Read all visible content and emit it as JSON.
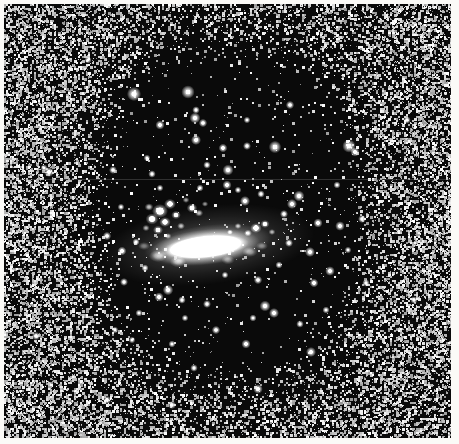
{
  "figure": {
    "kind": "astronomical-plate-photograph",
    "rendering": "halftone / dithered monochrome print",
    "width": 459,
    "height": 444,
    "caption": ""
  },
  "palette": {
    "paper": "#fbfaf7",
    "backdrop": "#f2f1ee",
    "sky_dark": "#0a0a0a",
    "ink_black": "#000000",
    "star_white": "#ffffff",
    "halo_gray": "#b4b4b4",
    "seam_gray": "#8c8c8c"
  },
  "margins": {
    "left": 4,
    "top": 4,
    "right": 8,
    "bottom": 6
  },
  "sky_field": {
    "x": 4,
    "y": 4,
    "width": 447,
    "height": 434
  },
  "scan_seam": {
    "y": 179,
    "opacity": 0.3
  },
  "noise_halo": {
    "description": "salt-and-pepper dithered grain forming a bright halo around a dark rounded-rectangular sky region",
    "center_x": 231,
    "center_y": 212,
    "inner_radius_x": 132,
    "inner_radius_y": 172,
    "outer_radius_x": 232,
    "outer_radius_y": 262,
    "superellipse_exponent": 2.7,
    "max_coverage": 0.52,
    "grain_cell": 2,
    "seed": 20250411
  },
  "dark_region": {
    "x_min": 86,
    "x_max": 382,
    "y_min": 22,
    "y_max": 402
  },
  "galaxy": {
    "core": {
      "center_x": 205,
      "center_y": 247,
      "radius_x": 44,
      "radius_y": 11,
      "rotation_deg": -6,
      "peak_brightness": 1.0,
      "label": "bright elongated nucleus"
    },
    "inner_disk": {
      "center_x": 208,
      "center_y": 245,
      "radius_x": 64,
      "radius_y": 20,
      "rotation_deg": -7,
      "peak_brightness": 0.55
    },
    "knot_complex": {
      "label": "clumpy star-forming knots, north-east of nucleus",
      "clumps": [
        {
          "x": 160,
          "y": 211,
          "r": 7.0,
          "b": 1.0
        },
        {
          "x": 170,
          "y": 204,
          "r": 5.2,
          "b": 0.95
        },
        {
          "x": 152,
          "y": 219,
          "r": 5.6,
          "b": 0.92
        },
        {
          "x": 165,
          "y": 222,
          "r": 5.0,
          "b": 0.9
        },
        {
          "x": 176,
          "y": 215,
          "r": 4.2,
          "b": 0.85
        },
        {
          "x": 158,
          "y": 230,
          "r": 4.4,
          "b": 0.82
        },
        {
          "x": 149,
          "y": 207,
          "r": 3.8,
          "b": 0.8
        },
        {
          "x": 181,
          "y": 226,
          "r": 3.4,
          "b": 0.72
        },
        {
          "x": 146,
          "y": 228,
          "r": 3.2,
          "b": 0.7
        },
        {
          "x": 192,
          "y": 208,
          "r": 4.6,
          "b": 0.88
        },
        {
          "x": 199,
          "y": 213,
          "r": 3.6,
          "b": 0.76
        },
        {
          "x": 186,
          "y": 200,
          "r": 3.0,
          "b": 0.66
        },
        {
          "x": 205,
          "y": 204,
          "r": 2.8,
          "b": 0.62
        },
        {
          "x": 168,
          "y": 236,
          "r": 3.0,
          "b": 0.64
        },
        {
          "x": 256,
          "y": 228,
          "r": 5.0,
          "b": 0.9
        },
        {
          "x": 265,
          "y": 224,
          "r": 4.0,
          "b": 0.82
        },
        {
          "x": 248,
          "y": 233,
          "r": 3.4,
          "b": 0.74
        },
        {
          "x": 238,
          "y": 226,
          "r": 3.0,
          "b": 0.68
        },
        {
          "x": 272,
          "y": 232,
          "r": 3.0,
          "b": 0.66
        },
        {
          "x": 230,
          "y": 232,
          "r": 2.6,
          "b": 0.6
        }
      ]
    },
    "outer_wisps": [
      {
        "x": 158,
        "y": 256,
        "r": 6.0,
        "b": 0.5
      },
      {
        "x": 250,
        "y": 252,
        "r": 5.0,
        "b": 0.46
      },
      {
        "x": 178,
        "y": 262,
        "r": 5.4,
        "b": 0.48
      },
      {
        "x": 228,
        "y": 260,
        "r": 4.4,
        "b": 0.42
      },
      {
        "x": 144,
        "y": 246,
        "r": 4.0,
        "b": 0.4
      },
      {
        "x": 262,
        "y": 246,
        "r": 4.0,
        "b": 0.38
      }
    ]
  },
  "stars": [
    {
      "x": 134,
      "y": 94,
      "r": 3.4
    },
    {
      "x": 188,
      "y": 92,
      "r": 3.2
    },
    {
      "x": 275,
      "y": 147,
      "r": 3.0
    },
    {
      "x": 349,
      "y": 146,
      "r": 3.2
    },
    {
      "x": 355,
      "y": 152,
      "r": 2.2
    },
    {
      "x": 160,
      "y": 125,
      "r": 2.2
    },
    {
      "x": 196,
      "y": 110,
      "r": 1.8
    },
    {
      "x": 228,
      "y": 170,
      "r": 2.6
    },
    {
      "x": 196,
      "y": 140,
      "r": 2.4
    },
    {
      "x": 207,
      "y": 165,
      "r": 1.8
    },
    {
      "x": 247,
      "y": 120,
      "r": 1.6
    },
    {
      "x": 195,
      "y": 118,
      "r": 2.6
    },
    {
      "x": 203,
      "y": 123,
      "r": 2.0
    },
    {
      "x": 247,
      "y": 146,
      "r": 1.9
    },
    {
      "x": 223,
      "y": 148,
      "r": 2.1
    },
    {
      "x": 113,
      "y": 170,
      "r": 1.9
    },
    {
      "x": 152,
      "y": 174,
      "r": 1.8
    },
    {
      "x": 299,
      "y": 196,
      "r": 2.6
    },
    {
      "x": 292,
      "y": 204,
      "r": 2.4
    },
    {
      "x": 245,
      "y": 201,
      "r": 2.4
    },
    {
      "x": 261,
      "y": 194,
      "r": 1.8
    },
    {
      "x": 318,
      "y": 223,
      "r": 2.2
    },
    {
      "x": 284,
      "y": 214,
      "r": 1.9
    },
    {
      "x": 340,
      "y": 226,
      "r": 2.3
    },
    {
      "x": 107,
      "y": 236,
      "r": 2.0
    },
    {
      "x": 122,
      "y": 251,
      "r": 2.1
    },
    {
      "x": 136,
      "y": 242,
      "r": 1.7
    },
    {
      "x": 310,
      "y": 252,
      "r": 2.4
    },
    {
      "x": 289,
      "y": 243,
      "r": 1.9
    },
    {
      "x": 330,
      "y": 271,
      "r": 2.3
    },
    {
      "x": 314,
      "y": 283,
      "r": 2.1
    },
    {
      "x": 258,
      "y": 280,
      "r": 2.0
    },
    {
      "x": 168,
      "y": 290,
      "r": 2.5
    },
    {
      "x": 159,
      "y": 297,
      "r": 2.2
    },
    {
      "x": 182,
      "y": 300,
      "r": 1.8
    },
    {
      "x": 207,
      "y": 304,
      "r": 1.9
    },
    {
      "x": 124,
      "y": 282,
      "r": 1.9
    },
    {
      "x": 265,
      "y": 306,
      "r": 2.6
    },
    {
      "x": 274,
      "y": 313,
      "r": 2.4
    },
    {
      "x": 253,
      "y": 318,
      "r": 1.7
    },
    {
      "x": 185,
      "y": 318,
      "r": 1.6
    },
    {
      "x": 139,
      "y": 313,
      "r": 1.7
    },
    {
      "x": 300,
      "y": 324,
      "r": 1.8
    },
    {
      "x": 216,
      "y": 330,
      "r": 2.0
    },
    {
      "x": 246,
      "y": 344,
      "r": 2.2
    },
    {
      "x": 311,
      "y": 352,
      "r": 2.4
    },
    {
      "x": 172,
      "y": 344,
      "r": 1.7
    },
    {
      "x": 132,
      "y": 340,
      "r": 1.6
    },
    {
      "x": 194,
      "y": 368,
      "r": 1.8
    },
    {
      "x": 258,
      "y": 389,
      "r": 2.3
    },
    {
      "x": 107,
      "y": 400,
      "r": 2.0
    },
    {
      "x": 172,
      "y": 405,
      "r": 1.9
    },
    {
      "x": 49,
      "y": 172,
      "r": 2.4
    },
    {
      "x": 44,
      "y": 168,
      "r": 1.7
    },
    {
      "x": 362,
      "y": 219,
      "r": 1.9
    },
    {
      "x": 366,
      "y": 283,
      "r": 1.8
    },
    {
      "x": 290,
      "y": 105,
      "r": 2.0
    },
    {
      "x": 227,
      "y": 185,
      "r": 2.2
    },
    {
      "x": 147,
      "y": 158,
      "r": 1.6
    },
    {
      "x": 337,
      "y": 185,
      "r": 1.7
    },
    {
      "x": 115,
      "y": 330,
      "r": 1.6
    },
    {
      "x": 326,
      "y": 310,
      "r": 1.7
    },
    {
      "x": 200,
      "y": 188,
      "r": 1.7
    },
    {
      "x": 238,
      "y": 190,
      "r": 1.6
    },
    {
      "x": 160,
      "y": 188,
      "r": 1.6
    },
    {
      "x": 279,
      "y": 265,
      "r": 1.7
    },
    {
      "x": 225,
      "y": 275,
      "r": 1.6
    },
    {
      "x": 145,
      "y": 268,
      "r": 1.7
    },
    {
      "x": 121,
      "y": 207,
      "r": 1.6
    },
    {
      "x": 348,
      "y": 250,
      "r": 1.6
    }
  ],
  "edge_stars": [
    {
      "x": 36,
      "y": 336,
      "r": 2.0
    },
    {
      "x": 407,
      "y": 120,
      "r": 1.8
    },
    {
      "x": 414,
      "y": 300,
      "r": 1.8
    },
    {
      "x": 88,
      "y": 60,
      "r": 1.7
    }
  ]
}
